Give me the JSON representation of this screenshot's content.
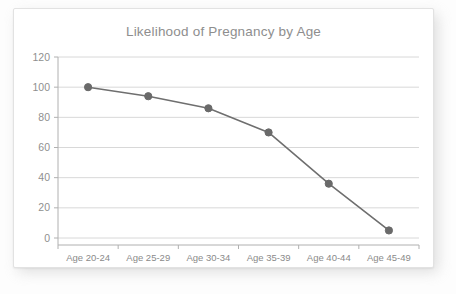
{
  "card": {
    "background_color": "#ffffff",
    "border_color": "#e2e2e2"
  },
  "chart_data": {
    "type": "line",
    "title": "Likelihood of Pregnancy by Age",
    "xlabel": "",
    "ylabel": "",
    "categories": [
      "Age 20-24",
      "Age 25-29",
      "Age 30-34",
      "Age 35-39",
      "Age 40-44",
      "Age 45-49"
    ],
    "values": [
      100,
      94,
      86,
      70,
      36,
      5
    ],
    "series": [
      {
        "name": "Likelihood of Pregnancy",
        "values": [
          100,
          94,
          86,
          70,
          36,
          5
        ]
      }
    ],
    "ylim": [
      0,
      120
    ],
    "yticks": [
      0,
      20,
      40,
      60,
      80,
      100,
      120
    ],
    "ytick_labels": [
      "0",
      "20",
      "40",
      "60",
      "80",
      "100",
      "120"
    ],
    "grid": true,
    "grid_axis": "y",
    "legend": false,
    "legend_position": "none",
    "line_color": "#6f6f6f",
    "marker_color": "#6a6a6a",
    "marker_shape": "circle",
    "grid_color": "#d8d8d8",
    "axis_color": "#b0b0b0",
    "title_color": "#8e8e8e",
    "tick_label_color": "#8a8a8a"
  }
}
